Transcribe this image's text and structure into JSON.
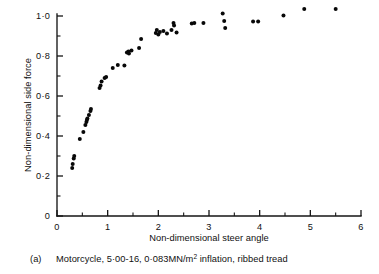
{
  "chart_data": {
    "type": "scatter",
    "title": "",
    "xlabel": "Non-dimensional steer angle",
    "ylabel": "Non-dimensional side force",
    "xlim": [
      0,
      6
    ],
    "ylim": [
      0,
      1.08
    ],
    "grid": false,
    "legend": null,
    "marker": "filled-circle",
    "marker_color": "#080808",
    "x_ticks_major": [
      0,
      1,
      2,
      3,
      4,
      5,
      6
    ],
    "x_tick_labels": [
      "0",
      "1",
      "2",
      "3",
      "4",
      "5",
      "6"
    ],
    "x_ticks_minor": [
      0.5,
      1.5,
      2.5,
      3.5,
      4.5,
      5.5
    ],
    "y_ticks_major": [
      0,
      0.2,
      0.4,
      0.6,
      0.8,
      1.0
    ],
    "y_tick_labels": [
      "0",
      "0·2",
      "0·4",
      "0·6",
      "0·8",
      "1·0"
    ],
    "y_ticks_minor": [
      0.1,
      0.3,
      0.5,
      0.7,
      0.9
    ],
    "points": [
      [
        0.3,
        0.24
      ],
      [
        0.31,
        0.26
      ],
      [
        0.33,
        0.288
      ],
      [
        0.34,
        0.3
      ],
      [
        0.45,
        0.385
      ],
      [
        0.52,
        0.42
      ],
      [
        0.56,
        0.455
      ],
      [
        0.58,
        0.47
      ],
      [
        0.59,
        0.48
      ],
      [
        0.6,
        0.487
      ],
      [
        0.63,
        0.505
      ],
      [
        0.66,
        0.525
      ],
      [
        0.67,
        0.535
      ],
      [
        0.84,
        0.64
      ],
      [
        0.86,
        0.652
      ],
      [
        0.88,
        0.672
      ],
      [
        0.94,
        0.69
      ],
      [
        0.97,
        0.695
      ],
      [
        1.1,
        0.74
      ],
      [
        1.2,
        0.755
      ],
      [
        1.33,
        0.752
      ],
      [
        1.38,
        0.818
      ],
      [
        1.41,
        0.823
      ],
      [
        1.42,
        0.812
      ],
      [
        1.47,
        0.828
      ],
      [
        1.62,
        0.84
      ],
      [
        1.66,
        0.885
      ],
      [
        1.95,
        0.915
      ],
      [
        1.97,
        0.93
      ],
      [
        2.0,
        0.908
      ],
      [
        2.03,
        0.92
      ],
      [
        2.1,
        0.925
      ],
      [
        2.17,
        0.912
      ],
      [
        2.26,
        0.93
      ],
      [
        2.3,
        0.965
      ],
      [
        2.31,
        0.952
      ],
      [
        2.36,
        0.918
      ],
      [
        2.66,
        0.962
      ],
      [
        2.71,
        0.965
      ],
      [
        2.89,
        0.965
      ],
      [
        3.27,
        1.012
      ],
      [
        3.3,
        0.975
      ],
      [
        3.32,
        0.94
      ],
      [
        3.87,
        0.972
      ],
      [
        3.97,
        0.972
      ],
      [
        4.47,
        1.002
      ],
      [
        4.88,
        1.035
      ],
      [
        5.5,
        1.035
      ]
    ]
  },
  "caption": {
    "label": "(a)",
    "text_before_sup": "Motorcycle, 5·00-16,  0·083MN/m",
    "sup": "2",
    "text_after_sup": " inflation, ribbed  tread"
  }
}
